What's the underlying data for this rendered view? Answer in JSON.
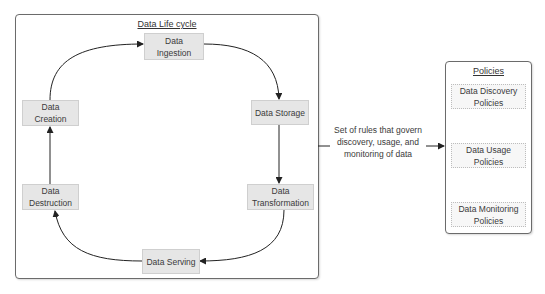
{
  "lifecycle": {
    "title": "Data Life cycle",
    "stages": [
      {
        "id": "ingestion",
        "label": "Data\nIngestion"
      },
      {
        "id": "storage",
        "label": "Data Storage"
      },
      {
        "id": "transformation",
        "label": "Data\nTransformation"
      },
      {
        "id": "serving",
        "label": "Data Serving"
      },
      {
        "id": "destruction",
        "label": "Data\nDestruction"
      },
      {
        "id": "creation",
        "label": "Data\nCreation"
      }
    ],
    "flow": [
      "creation",
      "ingestion",
      "storage",
      "transformation",
      "serving",
      "destruction",
      "creation"
    ]
  },
  "connector": {
    "label": "Set of rules that govern discovery, usage, and monitoring of data"
  },
  "policies": {
    "title": "Policies",
    "items": [
      {
        "label": "Data Discovery Policies"
      },
      {
        "label": "Data Usage Policies"
      },
      {
        "label": "Data Monitoring Policies"
      }
    ]
  },
  "colors": {
    "node_fill": "#e6e6e6",
    "border": "#6b6b6b",
    "arrow": "#222222"
  }
}
